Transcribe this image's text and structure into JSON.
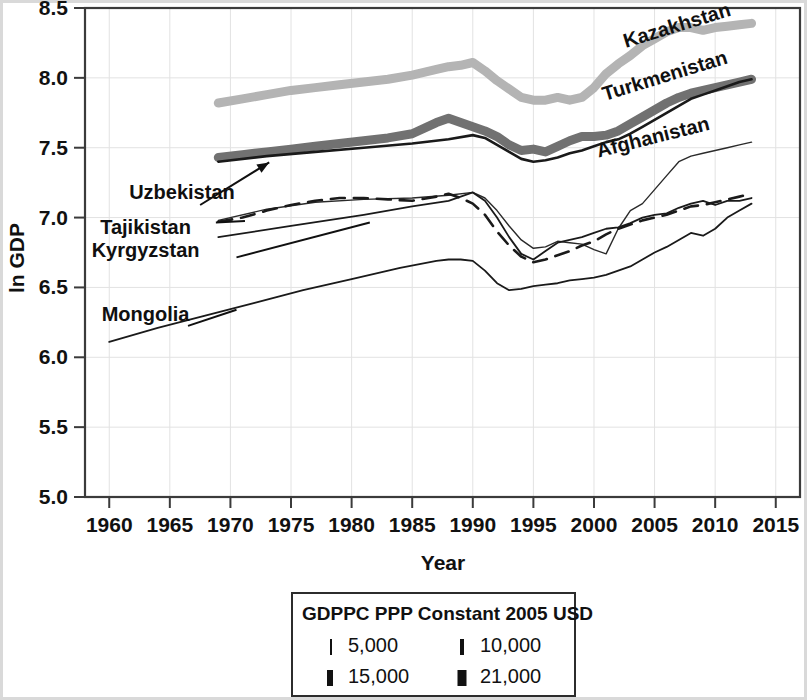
{
  "chart_data": {
    "type": "line",
    "title": "",
    "xlabel": "Year",
    "ylabel": "ln GDP",
    "xlim": [
      1958,
      2017
    ],
    "ylim": [
      5.0,
      8.5
    ],
    "grid": true,
    "x_ticks": [
      1960,
      1965,
      1970,
      1975,
      1980,
      1985,
      1990,
      1995,
      2000,
      2005,
      2010,
      2015
    ],
    "y_ticks": [
      5.0,
      5.5,
      6.0,
      6.5,
      7.0,
      7.5,
      8.0,
      8.5
    ],
    "x_tick_labels": [
      "1960",
      "1965",
      "1970",
      "1975",
      "1980",
      "1985",
      "1990",
      "1995",
      "2000",
      "2005",
      "2010",
      "2015"
    ],
    "y_tick_labels": [
      "5.0",
      "5.5",
      "6.0",
      "6.5",
      "7.0",
      "7.5",
      "8.0",
      "8.5"
    ],
    "legend": {
      "title": "GDPPC PPP Constant 2005 USD",
      "position": "below-plot",
      "entries": [
        {
          "label": "5,000",
          "width_px": 2
        },
        {
          "label": "10,000",
          "width_px": 4
        },
        {
          "label": "15,000",
          "width_px": 6
        },
        {
          "label": "21,000",
          "width_px": 9
        }
      ]
    },
    "series": [
      {
        "name": "Kazakhstan",
        "color": "#b4b4b4",
        "stroke_width": 9,
        "dash": "none",
        "label_x": 2007,
        "label_y": 8.33,
        "label_rotation": -17,
        "x": [
          1969,
          1971,
          1973,
          1975,
          1977,
          1979,
          1981,
          1983,
          1985,
          1987,
          1988,
          1989,
          1990,
          1991,
          1992,
          1993,
          1994,
          1995,
          1996,
          1997,
          1998,
          1999,
          2000,
          2001,
          2002,
          2003,
          2004,
          2005,
          2006,
          2007,
          2008,
          2009,
          2010,
          2011,
          2012,
          2013
        ],
        "y": [
          7.82,
          7.85,
          7.88,
          7.91,
          7.93,
          7.95,
          7.97,
          7.99,
          8.02,
          8.06,
          8.08,
          8.09,
          8.11,
          8.05,
          7.98,
          7.92,
          7.86,
          7.84,
          7.84,
          7.86,
          7.84,
          7.86,
          7.93,
          8.03,
          8.1,
          8.16,
          8.23,
          8.28,
          8.33,
          8.36,
          8.36,
          8.34,
          8.36,
          8.37,
          8.38,
          8.39
        ]
      },
      {
        "name": "Turkmenistan",
        "color": "#717171",
        "stroke_width": 9,
        "dash": "none",
        "label_x": 2006,
        "label_y": 7.97,
        "label_rotation": -17,
        "x": [
          1969,
          1971,
          1973,
          1975,
          1977,
          1979,
          1981,
          1983,
          1985,
          1987,
          1988,
          1989,
          1990,
          1991,
          1992,
          1993,
          1994,
          1995,
          1996,
          1997,
          1998,
          1999,
          2000,
          2001,
          2002,
          2003,
          2004,
          2005,
          2006,
          2007,
          2008,
          2009,
          2010,
          2011,
          2012,
          2013
        ],
        "y": [
          7.43,
          7.45,
          7.47,
          7.49,
          7.51,
          7.53,
          7.55,
          7.57,
          7.6,
          7.68,
          7.71,
          7.68,
          7.65,
          7.62,
          7.58,
          7.52,
          7.48,
          7.49,
          7.47,
          7.51,
          7.55,
          7.58,
          7.58,
          7.59,
          7.62,
          7.67,
          7.72,
          7.77,
          7.82,
          7.86,
          7.89,
          7.91,
          7.93,
          7.95,
          7.97,
          7.99
        ]
      },
      {
        "name": "Uzbekistan",
        "color": "#1a1a1a",
        "stroke_width": 2.6,
        "dash": "none",
        "label_x": 1966,
        "label_y": 7.13,
        "label_rotation": 0,
        "x": [
          1969,
          1973,
          1977,
          1981,
          1985,
          1988,
          1990,
          1991,
          1992,
          1993,
          1994,
          1995,
          1996,
          1997,
          1998,
          1999,
          2000,
          2001,
          2002,
          2003,
          2004,
          2005,
          2006,
          2007,
          2008,
          2009,
          2010,
          2011,
          2012,
          2013
        ],
        "y": [
          7.4,
          7.44,
          7.47,
          7.5,
          7.53,
          7.56,
          7.59,
          7.57,
          7.52,
          7.47,
          7.42,
          7.4,
          7.41,
          7.43,
          7.46,
          7.48,
          7.51,
          7.54,
          7.56,
          7.6,
          7.65,
          7.7,
          7.75,
          7.8,
          7.85,
          7.88,
          7.91,
          7.94,
          7.97,
          7.99
        ]
      },
      {
        "name": "Afghanistan",
        "color": "#2a2a2a",
        "stroke_width": 1.4,
        "dash": "none",
        "label_x": 2005,
        "label_y": 7.53,
        "label_rotation": -14,
        "x": [
          1969,
          1973,
          1977,
          1981,
          1985,
          1988,
          1990,
          1991,
          1992,
          1993,
          1994,
          1995,
          1996,
          1997,
          1998,
          1999,
          2000,
          2001,
          2002,
          2003,
          2004,
          2005,
          2006,
          2007,
          2008,
          2009,
          2010,
          2011,
          2012,
          2013
        ],
        "y": [
          6.98,
          7.06,
          7.11,
          7.13,
          7.14,
          7.16,
          7.18,
          7.14,
          7.05,
          6.94,
          6.84,
          6.78,
          6.79,
          6.83,
          6.82,
          6.81,
          6.77,
          6.74,
          6.92,
          7.05,
          7.1,
          7.2,
          7.3,
          7.4,
          7.44,
          7.46,
          7.48,
          7.5,
          7.52,
          7.54
        ]
      },
      {
        "name": "Tajikistan",
        "color": "#1a1a1a",
        "stroke_width": 2.6,
        "dash": "14,9",
        "label_x": 1963,
        "label_y": 6.88,
        "label_rotation": 0,
        "x": [
          1969,
          1971,
          1973,
          1975,
          1977,
          1979,
          1981,
          1983,
          1985,
          1987,
          1988,
          1989,
          1990,
          1991,
          1992,
          1993,
          1994,
          1995,
          1996,
          1997,
          1998,
          1999,
          2000,
          2001,
          2002,
          2003,
          2004,
          2005,
          2006,
          2007,
          2008,
          2009,
          2010,
          2011,
          2012,
          2013
        ],
        "y": [
          6.97,
          7.0,
          7.05,
          7.09,
          7.12,
          7.14,
          7.14,
          7.13,
          7.12,
          7.15,
          7.17,
          7.14,
          7.1,
          7.02,
          6.9,
          6.8,
          6.72,
          6.68,
          6.7,
          6.73,
          6.76,
          6.8,
          6.83,
          6.88,
          6.92,
          6.95,
          6.98,
          7.0,
          7.02,
          7.05,
          7.08,
          7.09,
          7.11,
          7.13,
          7.15,
          7.17
        ]
      },
      {
        "name": "Kyrgyzstan",
        "color": "#1a1a1a",
        "stroke_width": 1.8,
        "dash": "none",
        "label_x": 1963,
        "label_y": 6.72,
        "label_rotation": 0,
        "x": [
          1969,
          1975,
          1981,
          1985,
          1988,
          1990,
          1991,
          1992,
          1993,
          1994,
          1995,
          1996,
          1997,
          1998,
          1999,
          2000,
          2001,
          2002,
          2003,
          2004,
          2005,
          2006,
          2007,
          2008,
          2009,
          2010,
          2011,
          2012,
          2013
        ],
        "y": [
          6.86,
          6.94,
          7.02,
          7.08,
          7.12,
          7.18,
          7.12,
          7.0,
          6.86,
          6.74,
          6.7,
          6.76,
          6.82,
          6.84,
          6.86,
          6.89,
          6.92,
          6.93,
          6.96,
          7.0,
          7.02,
          7.03,
          7.07,
          7.1,
          7.12,
          7.09,
          7.12,
          7.12,
          7.14
        ]
      },
      {
        "name": "Mongolia",
        "color": "#1a1a1a",
        "stroke_width": 1.8,
        "dash": "none",
        "label_x": 1963,
        "label_y": 6.26,
        "label_rotation": 0,
        "x": [
          1960,
          1964,
          1968,
          1972,
          1976,
          1980,
          1984,
          1987,
          1988,
          1989,
          1990,
          1991,
          1992,
          1993,
          1994,
          1995,
          1996,
          1997,
          1998,
          1999,
          2000,
          2001,
          2002,
          2003,
          2004,
          2005,
          2006,
          2007,
          2008,
          2009,
          2010,
          2011,
          2012,
          2013
        ],
        "y": [
          6.11,
          6.21,
          6.3,
          6.39,
          6.48,
          6.56,
          6.64,
          6.69,
          6.7,
          6.7,
          6.69,
          6.62,
          6.53,
          6.48,
          6.49,
          6.51,
          6.52,
          6.53,
          6.55,
          6.56,
          6.57,
          6.59,
          6.62,
          6.65,
          6.7,
          6.75,
          6.79,
          6.84,
          6.89,
          6.87,
          6.92,
          7.0,
          7.05,
          7.1
        ]
      }
    ]
  }
}
